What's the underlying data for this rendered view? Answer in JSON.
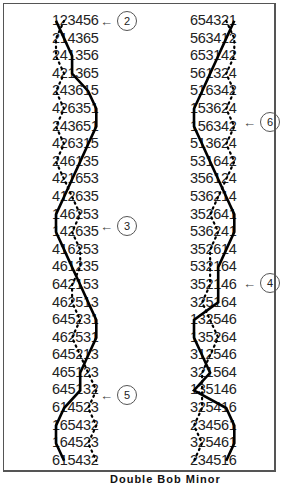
{
  "diagram": {
    "type": "change-ringing plain course",
    "left_column": {
      "rows": [
        "123456",
        "214365",
        "241356",
        "421365",
        "243615",
        "426351",
        "243651",
        "426315",
        "246135",
        "421653",
        "412635",
        "146253",
        "142635",
        "416253",
        "461235",
        "642153",
        "462513",
        "645231",
        "462531",
        "645213",
        "465123",
        "645132",
        "614523",
        "165432",
        "164523",
        "615432",
        "651423",
        "564132",
        "654312",
        "563421",
        "654321"
      ],
      "callouts": [
        {
          "label": "2",
          "row_index": 0
        },
        {
          "label": "3",
          "row_index": 12
        },
        {
          "label": "5",
          "row_index": 23
        }
      ]
    },
    "right_column": {
      "rows": [
        "654321",
        "563412",
        "653142",
        "561324",
        "516342",
        "153624",
        "156342",
        "513624",
        "531642",
        "356124",
        "536214",
        "352641",
        "536241",
        "352614",
        "532164",
        "352146",
        "325164",
        "132546",
        "135264",
        "312546",
        "321564",
        "135146",
        "325416",
        "234561",
        "325461",
        "234516",
        "324156",
        "231465",
        "213456",
        "124365",
        "123456"
      ],
      "callouts": [
        {
          "label": "6",
          "row_index": 6
        },
        {
          "label": "4",
          "row_index": 18
        }
      ]
    },
    "legend": {
      "solid_line": "path of bell 1 (treble)",
      "dotted_line": "path of working bell"
    },
    "caption": "Double Bob Minor"
  }
}
